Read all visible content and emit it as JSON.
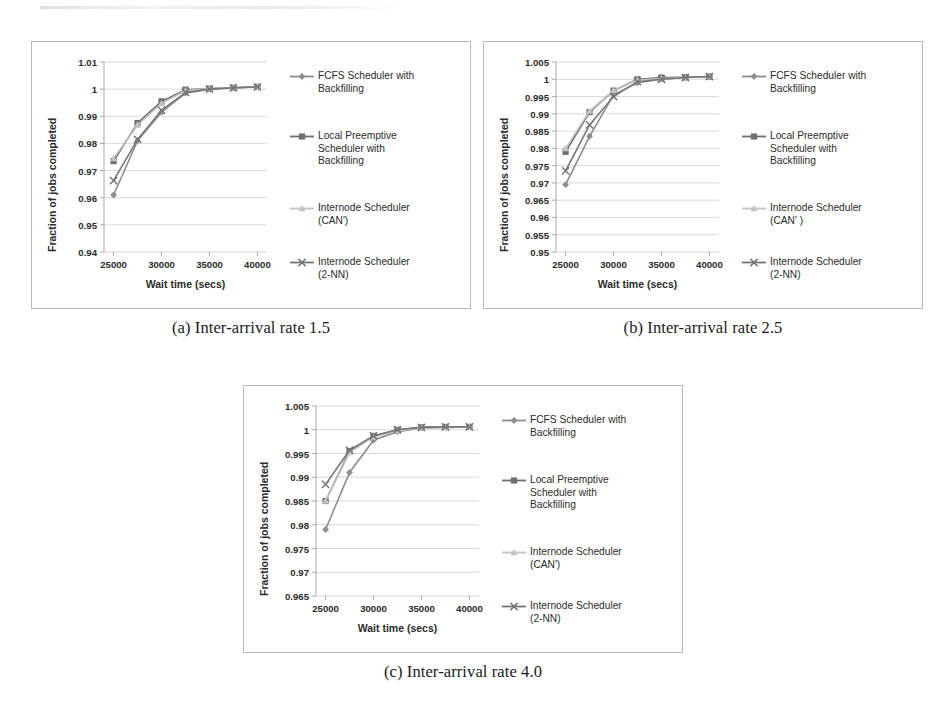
{
  "page": {
    "background": "#ffffff",
    "series_colors": {
      "fcfs": "#8d8d8d",
      "local_preemptive": "#6e6e6e",
      "internode_can": "#c3c3c3",
      "internode_2nn": "#777777"
    },
    "grid_color": "#cfcfcf",
    "axis_color": "#a9a9a9",
    "frame_color": "#b9b9b9"
  },
  "figures": [
    {
      "id": "figure-a",
      "caption": "(a) Inter-arrival rate 1.5",
      "chart_data": {
        "type": "line",
        "title": "",
        "xlabel": "Wait time (secs)",
        "ylabel": "Fraction of jobs completed",
        "x": [
          25000,
          27500,
          30000,
          32500,
          35000,
          37500,
          40000
        ],
        "xlim": [
          24000,
          41000
        ],
        "xticks": [
          25000,
          30000,
          35000,
          40000
        ],
        "xticklabels": [
          "25000",
          "30000",
          "35000",
          "40000"
        ],
        "ylim": [
          0.94,
          1.01
        ],
        "yticks": [
          0.94,
          0.95,
          0.96,
          0.97,
          0.98,
          0.99,
          1.0,
          1.01
        ],
        "yticklabels": [
          "0.94",
          "0.95",
          "0.96",
          "0.97",
          "0.98",
          "0.99",
          "1",
          "1.01"
        ],
        "grid": true,
        "legend_position": "right",
        "series": [
          {
            "name": "FCFS Scheduler with\nBackfilling",
            "marker": "diamond",
            "color": "#8d8d8d",
            "values": [
              0.961,
              0.981,
              0.9915,
              0.9985,
              1.0,
              1.0005,
              1.0008
            ]
          },
          {
            "name": "Local Preemptive\nScheduler with\nBackfilling",
            "marker": "square",
            "color": "#6e6e6e",
            "values": [
              0.9735,
              0.9875,
              0.9955,
              0.9998,
              1.0002,
              1.0005,
              1.0008
            ]
          },
          {
            "name": "Internode Scheduler\n(CAN')",
            "marker": "triangle",
            "color": "#c3c3c3",
            "values": [
              0.9745,
              0.9868,
              0.9947,
              0.9995,
              1.0002,
              1.0005,
              1.0008
            ]
          },
          {
            "name": "Internode Scheduler\n(2-NN)",
            "marker": "cross",
            "color": "#777777",
            "values": [
              0.9663,
              0.9815,
              0.9922,
              0.9988,
              1.0,
              1.0005,
              1.0008
            ]
          }
        ]
      }
    },
    {
      "id": "figure-b",
      "caption": "(b) Inter-arrival rate 2.5",
      "chart_data": {
        "type": "line",
        "title": "",
        "xlabel": "Wait time (secs)",
        "ylabel": "Fraction of jobs completed",
        "x": [
          25000,
          27500,
          30000,
          32500,
          35000,
          37500,
          40000
        ],
        "xlim": [
          24000,
          41000
        ],
        "xticks": [
          25000,
          30000,
          35000,
          40000
        ],
        "xticklabels": [
          "25000",
          "30000",
          "35000",
          "40000"
        ],
        "ylim": [
          0.95,
          1.005
        ],
        "yticks": [
          0.95,
          0.955,
          0.96,
          0.965,
          0.97,
          0.975,
          0.98,
          0.985,
          0.99,
          0.995,
          1.0,
          1.005
        ],
        "yticklabels": [
          "0.95",
          "0.955",
          "0.96",
          "0.965",
          "0.97",
          "0.975",
          "0.98",
          "0.985",
          "0.99",
          "0.995",
          "1",
          "1.005"
        ],
        "grid": true,
        "legend_position": "right",
        "series": [
          {
            "name": "FCFS Scheduler with\nBackfilling",
            "marker": "diamond",
            "color": "#8d8d8d",
            "values": [
              0.9695,
              0.9835,
              0.9955,
              0.999,
              1.0,
              1.0005,
              1.0008
            ]
          },
          {
            "name": "Local Preemptive\nScheduler with\nBackfilling",
            "marker": "square",
            "color": "#6e6e6e",
            "values": [
              0.979,
              0.9905,
              0.9967,
              1.0,
              1.0005,
              1.0006,
              1.0008
            ]
          },
          {
            "name": "Internode Scheduler\n(CAN' )",
            "marker": "triangle",
            "color": "#c3c3c3",
            "values": [
              0.98,
              0.9908,
              0.9968,
              0.9998,
              1.0002,
              1.0005,
              1.0008
            ]
          },
          {
            "name": "Internode Scheduler\n(2-NN)",
            "marker": "cross",
            "color": "#777777",
            "values": [
              0.9735,
              0.9868,
              0.995,
              0.9993,
              1.0,
              1.0005,
              1.0008
            ]
          }
        ]
      }
    },
    {
      "id": "figure-c",
      "caption": "(c) Inter-arrival rate 4.0",
      "chart_data": {
        "type": "line",
        "title": "",
        "xlabel": "Wait time (secs)",
        "ylabel": "Fraction of jobs completed",
        "x": [
          25000,
          27500,
          30000,
          32500,
          35000,
          37500,
          40000
        ],
        "xlim": [
          24000,
          41000
        ],
        "xticks": [
          25000,
          30000,
          35000,
          40000
        ],
        "xticklabels": [
          "25000",
          "30000",
          "35000",
          "40000"
        ],
        "ylim": [
          0.965,
          1.005
        ],
        "yticks": [
          0.965,
          0.97,
          0.975,
          0.98,
          0.985,
          0.99,
          0.995,
          1.0,
          1.005
        ],
        "yticklabels": [
          "0.965",
          "0.97",
          "0.975",
          "0.98",
          "0.985",
          "0.99",
          "0.995",
          "1",
          "1.005"
        ],
        "grid": true,
        "legend_position": "right",
        "series": [
          {
            "name": "FCFS Scheduler with\nBackfilling",
            "marker": "diamond",
            "color": "#8d8d8d",
            "values": [
              0.979,
              0.991,
              0.9978,
              0.9996,
              1.0004,
              1.0005,
              1.0006
            ]
          },
          {
            "name": "Local Preemptive\nScheduler with\nBackfilling",
            "marker": "square",
            "color": "#6e6e6e",
            "values": [
              0.985,
              0.9955,
              0.9987,
              1.0,
              1.0005,
              1.0006,
              1.0006
            ]
          },
          {
            "name": "Internode Scheduler\n(CAN')",
            "marker": "triangle",
            "color": "#c3c3c3",
            "values": [
              0.985,
              0.9952,
              0.9985,
              0.9998,
              1.0004,
              1.0005,
              1.0006
            ]
          },
          {
            "name": "Internode Scheduler\n(2-NN)",
            "marker": "cross",
            "color": "#777777",
            "values": [
              0.9885,
              0.9957,
              0.9987,
              1.0,
              1.0005,
              1.0006,
              1.0006
            ]
          }
        ]
      }
    }
  ]
}
